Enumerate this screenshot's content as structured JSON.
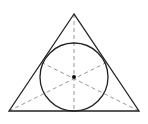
{
  "diagram": {
    "shapes": [
      "triangle",
      "incircle",
      "center-point",
      "median-lines"
    ],
    "colors": {
      "stroke": "#222222",
      "dashed": "#888888",
      "point": "#111111",
      "background": "#ffffff"
    }
  }
}
